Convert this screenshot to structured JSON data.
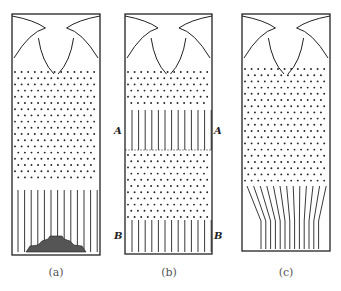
{
  "panels": [
    {
      "id": "a",
      "label": "(a)",
      "description": "Dots above, vertical tubes below with a sediment heap at the bottom"
    },
    {
      "id": "b",
      "label": "(b)",
      "description": "Dots with a band of vertical lines between A levels and lines below B levels"
    },
    {
      "id": "c",
      "label": "(c)",
      "description": "Dots above, converging lines funneling to the bottom"
    }
  ],
  "markers": {
    "A": "A",
    "B": "B"
  },
  "colors": {
    "ink": "#222222",
    "background": "#ffffff"
  }
}
